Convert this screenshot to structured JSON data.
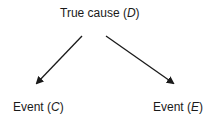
{
  "diagram": {
    "nodes": {
      "D": {
        "prefix": "True cause (",
        "var": "D",
        "suffix": ")"
      },
      "C": {
        "prefix": "Event (",
        "var": "C",
        "suffix": ")"
      },
      "E": {
        "prefix": "Event (",
        "var": "E",
        "suffix": ")"
      }
    },
    "edges": [
      {
        "from": "D",
        "to": "C"
      },
      {
        "from": "D",
        "to": "E"
      }
    ],
    "colors": {
      "text": "#1a1a1a",
      "arrow": "#1a1a1a",
      "background": "#ffffff"
    }
  }
}
